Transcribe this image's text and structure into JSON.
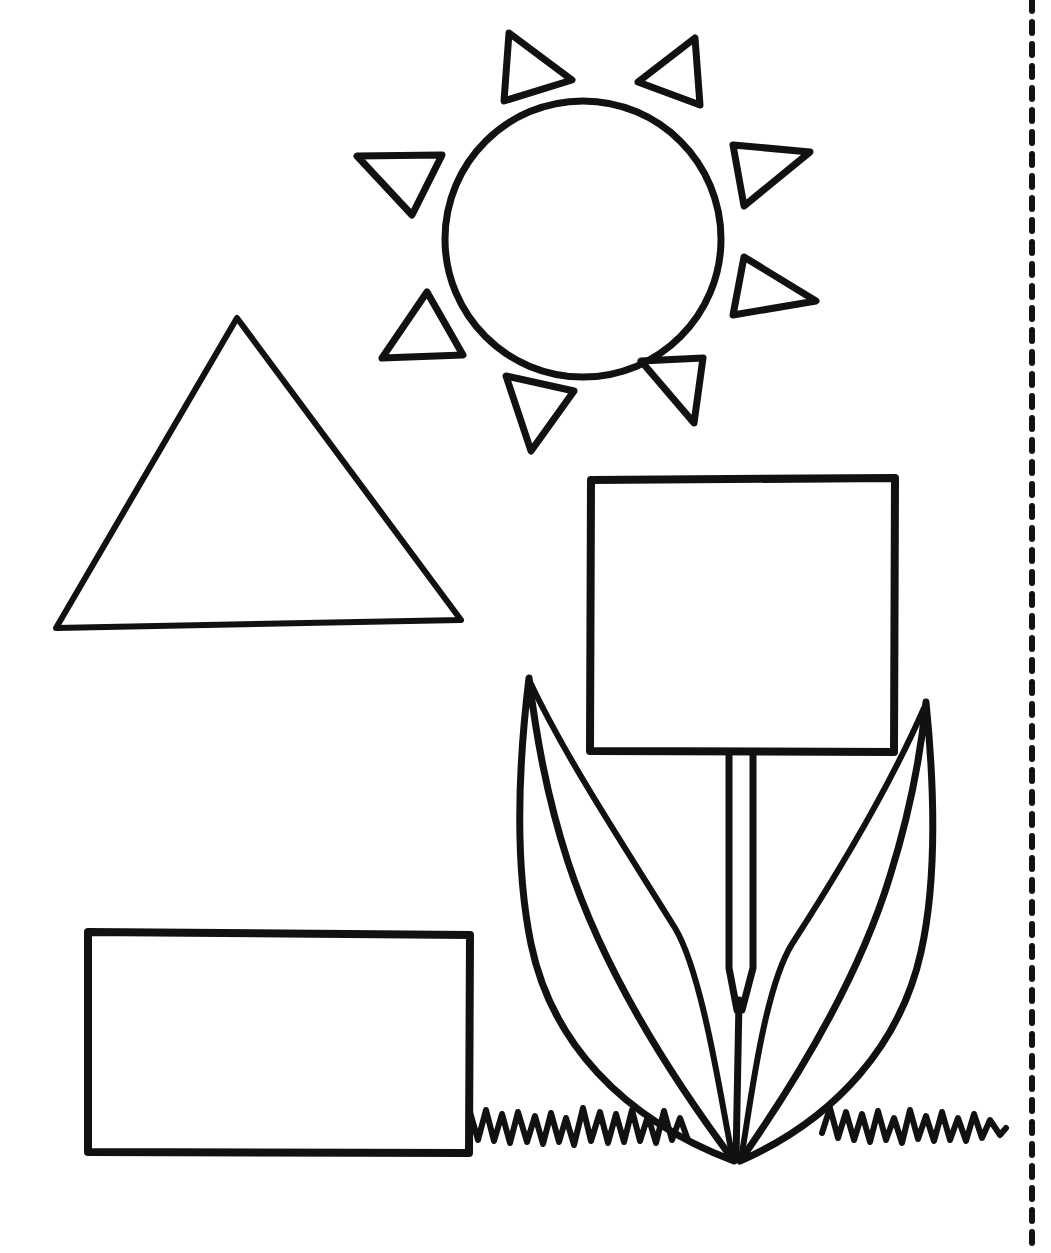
{
  "page": {
    "width": 1051,
    "height": 1253,
    "background_color": "#ffffff",
    "ink_color": "#111111",
    "style": "black outline line-art, uncolored coloring page"
  },
  "drawing": {
    "description": "Black-and-white line drawing of a sun, a triangle, a rectangle and a flower whose head is a square, with grass along the bottom and a dashed cut line down the right edge.",
    "objects": [
      {
        "name": "sun",
        "label": "sun",
        "parts": [
          "circle",
          "ray-triangles"
        ],
        "ray_count": 8,
        "circle": {
          "cx": 583,
          "cy": 239,
          "r": 138,
          "stroke_width": 7
        }
      },
      {
        "name": "triangle",
        "label": "triangle",
        "apex": [
          237,
          318
        ],
        "base_left": [
          56,
          628
        ],
        "base_right": [
          461,
          620
        ],
        "stroke_width": 6
      },
      {
        "name": "rectangle",
        "label": "rectangle",
        "x": 88,
        "y": 932,
        "width": 382,
        "height": 221,
        "stroke_width": 8
      },
      {
        "name": "flower",
        "label": "flower",
        "parts": [
          "square-head",
          "stem",
          "left-leaf",
          "right-leaf"
        ],
        "square_head": {
          "x": 590,
          "y": 478,
          "width": 305,
          "height": 274,
          "stroke_width": 8
        },
        "stem": {
          "left_x": 728,
          "right_x": 753,
          "top_y": 752,
          "bottom_y": 1160
        }
      },
      {
        "name": "grass",
        "label": "grass",
        "segments": [
          "left-grass",
          "right-grass"
        ],
        "baseline_y": 1112
      },
      {
        "name": "cut-line",
        "label": "dashed cut line",
        "x": 1032,
        "dash_length": 11,
        "gap_length": 11,
        "stroke_width": 6
      }
    ]
  }
}
